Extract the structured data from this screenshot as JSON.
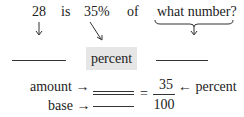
{
  "sentence": {
    "words": [
      "28",
      "is",
      "35%",
      "of",
      "what number?"
    ]
  },
  "labels": {
    "percent_box": "percent"
  },
  "proportion": {
    "amount_label": "amount",
    "base_label": "base",
    "equals": "=",
    "numerator": "35",
    "denominator": "100",
    "percent_label": "percent",
    "arrow_right": "→",
    "arrow_left": "←"
  }
}
